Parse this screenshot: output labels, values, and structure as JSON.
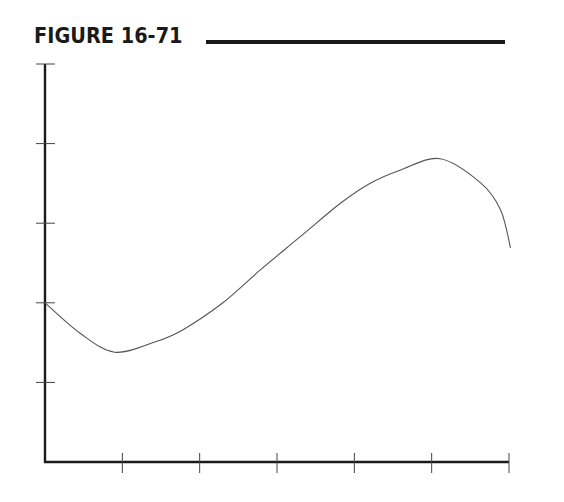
{
  "figure": {
    "label": "FIGURE 16-71"
  },
  "chart_data": {
    "type": "line",
    "title": "FIGURE 16-71",
    "xlabel": "",
    "ylabel": "",
    "x_ticks": [
      0,
      1,
      2,
      3,
      4,
      5,
      6
    ],
    "y_ticks": [
      0,
      1,
      2,
      3,
      4,
      5
    ],
    "tick_labels_shown": false,
    "xlim": [
      0,
      6
    ],
    "ylim": [
      0,
      5
    ],
    "grid": false,
    "legend": null,
    "series": [
      {
        "name": "curve",
        "x": [
          0,
          0.45,
          0.9,
          1.4,
          1.78,
          2.3,
          2.78,
          3.3,
          3.82,
          4.2,
          4.6,
          5.11,
          5.63,
          5.89,
          6.02
        ],
        "y": [
          2.0,
          1.62,
          1.38,
          1.5,
          1.66,
          2.0,
          2.41,
          2.83,
          3.25,
          3.5,
          3.67,
          3.81,
          3.51,
          3.17,
          2.69
        ]
      }
    ]
  },
  "colors": {
    "axis": "#1a1a1a",
    "curve": "#555555",
    "tick": "#444444"
  }
}
